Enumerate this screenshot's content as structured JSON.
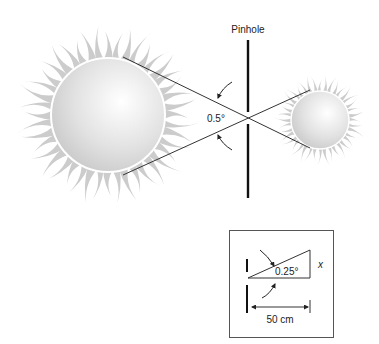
{
  "diagram": {
    "pinhole_label": "Pinhole",
    "angle_label": "0.5°",
    "inset": {
      "angle_label": "0.25°",
      "height_label": "x",
      "distance_label": "50 cm"
    }
  },
  "colors": {
    "ray_fill": "#c8c8c8",
    "sun_highlight": "#ffffff",
    "sun_shadow": "#c4c4c4",
    "line": "#333333",
    "pinhole": "#111111"
  }
}
